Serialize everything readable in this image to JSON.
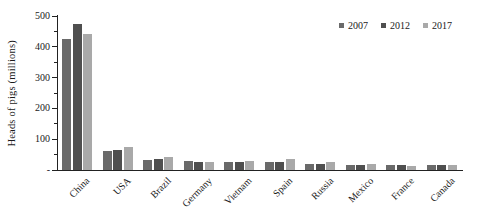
{
  "chart_data": {
    "type": "bar",
    "title": "",
    "xlabel": "",
    "ylabel": "Heads of pigs (millions)",
    "ylim": [
      0,
      500
    ],
    "y_major_step": 100,
    "y_minor_step": 50,
    "y_tick_labels": [
      "-",
      "100",
      "200",
      "300",
      "400",
      "500"
    ],
    "categories": [
      "China",
      "USA",
      "Brazil",
      "Germany",
      "Vietnam",
      "Spain",
      "Russia",
      "Mexico",
      "France",
      "Canada"
    ],
    "series": [
      {
        "name": "2007",
        "color": "#6a6a6a",
        "values": [
          425,
          62,
          31,
          28,
          27,
          26,
          18,
          17,
          17,
          16
        ]
      },
      {
        "name": "2012",
        "color": "#4f4f4f",
        "values": [
          475,
          66,
          35,
          27,
          26,
          27,
          20,
          17,
          16,
          16
        ]
      },
      {
        "name": "2017",
        "color": "#a9a9a9",
        "values": [
          440,
          74,
          41,
          26,
          29,
          37,
          27,
          18,
          14,
          15
        ]
      }
    ],
    "legend_position": "top-right",
    "grid": false,
    "axis_color": "#1a1a1a",
    "text_color": "#1a1a1a"
  }
}
